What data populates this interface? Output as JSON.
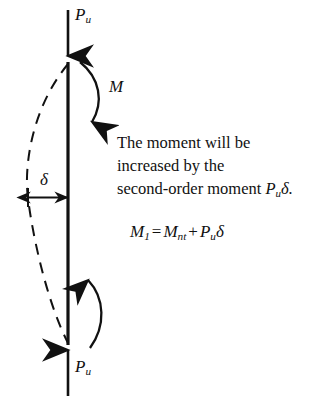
{
  "figure": {
    "name": "second-order-moment-column-diagram",
    "background_color": "#ffffff",
    "ink_color": "#111111"
  },
  "labels": {
    "load_top": {
      "symbol": "P",
      "subscript": "u"
    },
    "load_bottom": {
      "symbol": "P",
      "subscript": "u"
    },
    "moment": "M",
    "deflection": "δ"
  },
  "annotation": {
    "line1": "The moment will be",
    "line2": "increased by the",
    "line3_prefix": "second-order moment ",
    "line3_symbol": "P",
    "line3_subscript": "u",
    "line3_suffix": "δ."
  },
  "equation": {
    "lhs_symbol": "M",
    "lhs_subscript": "1",
    "equals": "=",
    "term1_symbol": "M",
    "term1_subscript": "nt",
    "plus": "+",
    "term2_symbol": "P",
    "term2_subscript": "u",
    "term2_factor": "δ"
  },
  "graphics": {
    "column": {
      "x": 68,
      "y_top": 62,
      "y_bottom": 345,
      "stroke_width": 3
    },
    "arrow_top": {
      "x": 68,
      "y_start": 10,
      "y_end": 58,
      "direction": "down"
    },
    "arrow_bottom": {
      "x": 68,
      "y_start": 396,
      "y_end": 348,
      "direction": "up"
    },
    "moment_arc_upper": {
      "bow": "right",
      "arrowhead": "bottom"
    },
    "moment_arc_lower": {
      "bow": "right",
      "arrowhead": "top"
    },
    "deflection_curve": {
      "style": "dashed",
      "bow": "left",
      "max_offset_px": 40
    },
    "dimension_line": {
      "x_start": 28,
      "x_end": 68,
      "y": 197,
      "heads": "both"
    }
  }
}
